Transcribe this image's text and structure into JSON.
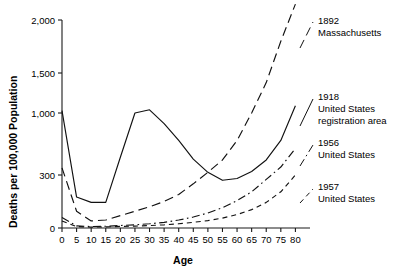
{
  "chart_data": {
    "type": "line",
    "title": "",
    "xlabel": "Age",
    "ylabel": "Deaths per 100,000 Population",
    "x": [
      0,
      5,
      10,
      15,
      20,
      25,
      30,
      35,
      40,
      45,
      50,
      55,
      60,
      65,
      70,
      75,
      80
    ],
    "xlim": [
      0,
      85
    ],
    "xtick_labels": [
      "0",
      "5",
      "10",
      "15",
      "20",
      "25",
      "30",
      "35",
      "40",
      "45",
      "50",
      "55",
      "60",
      "65",
      "70",
      "75",
      "80"
    ],
    "ytick_labels": [
      "0",
      "300",
      "1,000",
      "1,500",
      "2,000"
    ],
    "ytick_values": [
      0,
      300,
      1000,
      1500,
      2000
    ],
    "yscale": "broken-nonlinear",
    "ylim": [
      0,
      2000
    ],
    "grid": false,
    "legend": "annotations-right",
    "series": [
      {
        "name": "1892 Massachusetts",
        "label_year": "1892",
        "label_place": "Massachusetts",
        "style": "long-dash",
        "color": "#111111",
        "x": [
          0,
          5,
          10,
          15,
          20,
          25,
          30,
          35,
          40,
          45,
          50,
          55,
          60,
          65,
          70,
          75,
          80
        ],
        "values": [
          380,
          95,
          40,
          45,
          70,
          95,
          120,
          150,
          190,
          250,
          330,
          470,
          690,
          1000,
          1380,
          1800,
          2150
        ]
      },
      {
        "name": "1918 United States registration area",
        "label_year": "1918",
        "label_place": "United States registration area",
        "style": "solid",
        "color": "#111111",
        "x": [
          0,
          5,
          10,
          15,
          20,
          25,
          30,
          35,
          40,
          45,
          50,
          55,
          60,
          65,
          70,
          75,
          80
        ],
        "values": [
          1030,
          175,
          145,
          145,
          500,
          1000,
          1040,
          880,
          690,
          480,
          330,
          270,
          280,
          340,
          470,
          690,
          1090
        ]
      },
      {
        "name": "1956 United States",
        "label_year": "1956",
        "label_place": "United States",
        "style": "dash-dot",
        "color": "#111111",
        "x": [
          0,
          5,
          10,
          15,
          20,
          25,
          30,
          35,
          40,
          45,
          50,
          55,
          60,
          65,
          70,
          75,
          80
        ],
        "values": [
          60,
          12,
          8,
          10,
          14,
          18,
          24,
          32,
          45,
          62,
          85,
          115,
          155,
          205,
          275,
          390,
          600
        ]
      },
      {
        "name": "1957 United States",
        "label_year": "1957",
        "label_place": "United States",
        "style": "short-dash",
        "color": "#111111",
        "x": [
          0,
          5,
          10,
          15,
          20,
          25,
          30,
          35,
          40,
          45,
          50,
          55,
          60,
          65,
          70,
          75,
          80
        ],
        "values": [
          40,
          8,
          5,
          6,
          9,
          11,
          14,
          18,
          24,
          32,
          42,
          56,
          76,
          104,
          145,
          205,
          300
        ]
      }
    ],
    "annotations": [
      {
        "year": "1892",
        "line1": "Massachusetts",
        "line2": ""
      },
      {
        "year": "1918",
        "line1": "United States",
        "line2": "registration area"
      },
      {
        "year": "1956",
        "line1": "United States",
        "line2": ""
      },
      {
        "year": "1957",
        "line1": "United States",
        "line2": ""
      }
    ]
  },
  "axes": {
    "y_title": "Deaths per 100,000 Population",
    "x_title": "Age"
  }
}
